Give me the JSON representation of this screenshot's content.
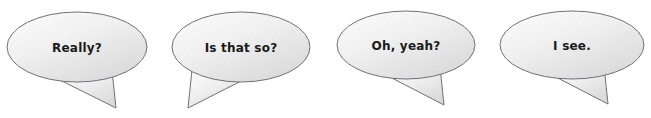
{
  "canvas": {
    "width": 651,
    "height": 118,
    "background": "#ffffff"
  },
  "style": {
    "outline_color": "#6e6e72",
    "fill_light": "#fdfdfd",
    "fill_mid": "#efefef",
    "fill_dark": "#dcdcdc",
    "text_color": "#1a1a1a",
    "hatch_color": "#e2e2e2"
  },
  "bubbles": [
    {
      "id": "bubble-1",
      "text": "Really?",
      "cx": 77,
      "cy": 47,
      "rx": 70,
      "ry": 35,
      "text_x": 77,
      "text_y": 48,
      "tail": "M 58,79 L 112,70 L 116,108 Z",
      "tail_direction": "down-right"
    },
    {
      "id": "bubble-2",
      "text": "Is that so?",
      "cx": 241,
      "cy": 47,
      "rx": 69,
      "ry": 35,
      "text_x": 241,
      "text_y": 48,
      "tail": "M 247,78 L 192,70 L 188,108 Z",
      "tail_direction": "down-left"
    },
    {
      "id": "bubble-3",
      "text": "Oh, yeah?",
      "cx": 406,
      "cy": 45,
      "rx": 69,
      "ry": 34,
      "text_x": 406,
      "text_y": 46,
      "tail": "M 388,76 L 440,67 L 444,105 Z",
      "tail_direction": "down-right"
    },
    {
      "id": "bubble-4",
      "text": "I see.",
      "cx": 572,
      "cy": 45,
      "rx": 72,
      "ry": 34,
      "text_x": 572,
      "text_y": 46,
      "tail": "M 552,75 L 604,66 L 608,104 Z",
      "tail_direction": "down-right"
    }
  ]
}
